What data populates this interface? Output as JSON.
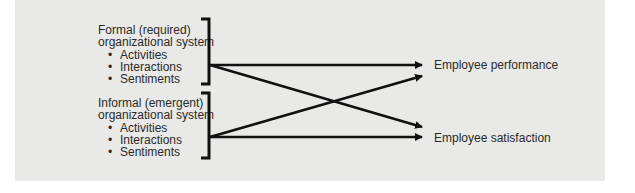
{
  "diagram": {
    "inputs": [
      {
        "title_line1": "Formal (required)",
        "title_line2": "organizational system",
        "items": [
          "Activities",
          "Interactions",
          "Sentiments"
        ]
      },
      {
        "title_line1": "Informal (emergent)",
        "title_line2": "organizational system",
        "items": [
          "Activities",
          "Interactions",
          "Sentiments"
        ]
      }
    ],
    "outputs": [
      {
        "label": "Employee performance"
      },
      {
        "label": "Employee satisfaction"
      }
    ],
    "colors": {
      "background": "#e9e9e7",
      "stroke": "#111111",
      "text": "#2a2a2a"
    }
  }
}
